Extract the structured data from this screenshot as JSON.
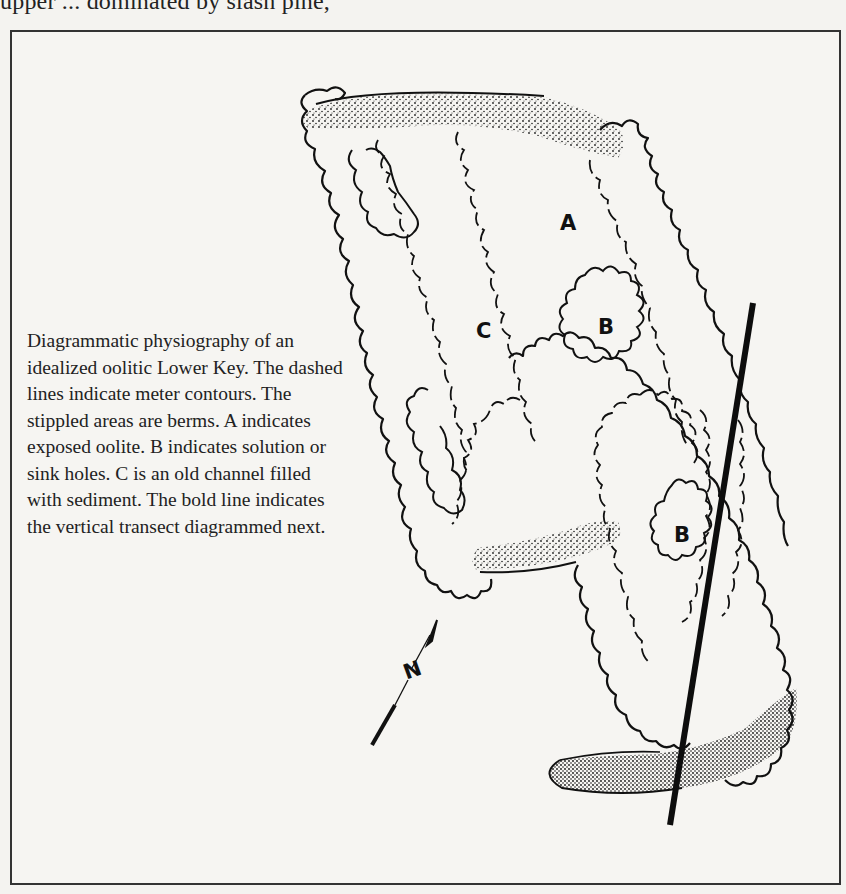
{
  "page": {
    "top_text_fragment": "upper ... dominated by slash pine,"
  },
  "figure": {
    "caption": "Diagrammatic physiography of an idealized oolitic Lower Key. The dashed lines indicate meter contours. The stippled areas are berms. A indicates exposed oolite. B indicates solution or sink holes. C is an old channel filled with sediment. The bold line indicates the vertical transect diagrammed next.",
    "labels": {
      "a": "A",
      "b1": "B",
      "b2": "B",
      "c": "C",
      "north": "N"
    },
    "legend_meaning": {
      "dashed_lines": "meter contours",
      "stippled_areas": "berms",
      "A": "exposed oolite",
      "B": "solution or sink holes",
      "C": "old channel filled with sediment",
      "bold_line": "vertical transect"
    }
  }
}
